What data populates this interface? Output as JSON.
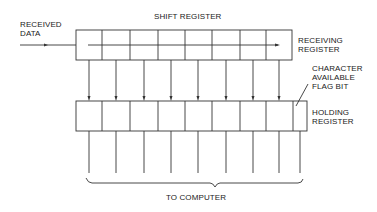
{
  "labels": {
    "received_data_1": "RECEIVED",
    "received_data_2": "DATA",
    "shift_register": "SHIFT REGISTER",
    "receiving_register_1": "RECEIVING",
    "receiving_register_2": "REGISTER",
    "flag_1": "CHARACTER",
    "flag_2": "AVAILABLE",
    "flag_3": "FLAG BIT",
    "holding_register_1": "HOLDING",
    "holding_register_2": "REGISTER",
    "to_computer": "TO COMPUTER"
  },
  "diagram": {
    "receiving_register_cells": 8,
    "holding_register_cells": 9,
    "parallel_lines": 8,
    "stroke_color": "#333333"
  }
}
